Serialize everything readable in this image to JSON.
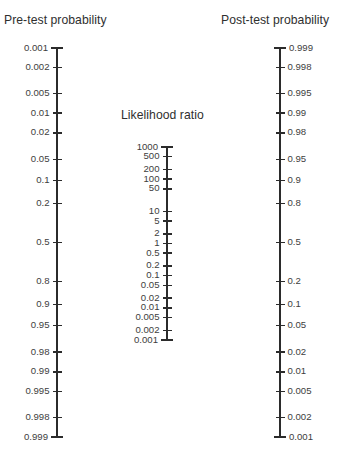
{
  "figure": {
    "type": "fagan-nomogram",
    "background_color": "#ffffff",
    "ink_color": "#2b2b2b",
    "text_color": "#3a3a3a"
  },
  "titles": {
    "pretest": "Pre-test probability",
    "likelihood_ratio": "Likelihood ratio",
    "posttest": "Post-test probability"
  },
  "chart_data": {
    "type": "nomogram",
    "axes": [
      {
        "name": "pretest",
        "label": "Pre-test probability",
        "scale": "logit",
        "direction": "inverted",
        "x": 57,
        "y_top": 48,
        "y_bottom": 437,
        "label_side": "left",
        "ticks": [
          0.001,
          0.002,
          0.005,
          0.01,
          0.02,
          0.05,
          0.1,
          0.2,
          0.5,
          0.8,
          0.9,
          0.95,
          0.98,
          0.99,
          0.995,
          0.998,
          0.999
        ],
        "tick_labels": [
          "0.001",
          "0.002",
          "0.005",
          "0.01",
          "0.02",
          "0.05",
          "0.1",
          "0.2",
          "0.5",
          "0.8",
          "0.9",
          "0.95",
          "0.98",
          "0.99",
          "0.995",
          "0.998",
          "0.999"
        ]
      },
      {
        "name": "likelihood_ratio",
        "label": "Likelihood ratio",
        "scale": "log10",
        "direction": "inverted",
        "x": 167,
        "y_top": 147,
        "y_bottom": 340,
        "label_side": "left",
        "ticks": [
          1000,
          500,
          200,
          100,
          50,
          10,
          5,
          2,
          1,
          0.5,
          0.2,
          0.1,
          0.05,
          0.02,
          0.01,
          0.005,
          0.002,
          0.001
        ],
        "tick_labels": [
          "1000",
          "500",
          "200",
          "100",
          "50",
          "10",
          "5",
          "2",
          "1",
          "0.5",
          "0.2",
          "0.1",
          "0.05",
          "0.02",
          "0.01",
          "0.005",
          "0.002",
          "0.001"
        ]
      },
      {
        "name": "posttest",
        "label": "Post-test probability",
        "scale": "logit",
        "direction": "normal",
        "x": 280,
        "y_top": 48,
        "y_bottom": 437,
        "label_side": "right",
        "ticks": [
          0.999,
          0.998,
          0.995,
          0.99,
          0.98,
          0.95,
          0.9,
          0.8,
          0.5,
          0.2,
          0.1,
          0.05,
          0.02,
          0.01,
          0.005,
          0.002,
          0.001
        ],
        "tick_labels": [
          "0.999",
          "0.998",
          "0.995",
          "0.99",
          "0.98",
          "0.95",
          "0.9",
          "0.8",
          "0.5",
          "0.2",
          "0.1",
          "0.05",
          "0.02",
          "0.01",
          "0.005",
          "0.002",
          "0.001"
        ]
      }
    ],
    "connector_lines": []
  }
}
